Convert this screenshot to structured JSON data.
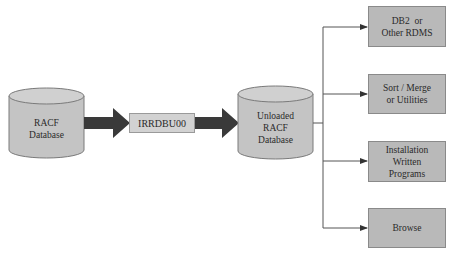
{
  "diagram": {
    "source": {
      "label_lines": [
        "RACF",
        "Database"
      ],
      "shape": "cylinder"
    },
    "process": {
      "label": "IRRDBU00",
      "shape": "box"
    },
    "output": {
      "label_lines": [
        "Unloaded",
        "RACF",
        "Database"
      ],
      "shape": "cylinder"
    },
    "targets": [
      {
        "label_lines": [
          "DB2  or",
          "Other RDMS"
        ]
      },
      {
        "label_lines": [
          "Sort / Merge",
          "or Utilities"
        ]
      },
      {
        "label_lines": [
          "Installation",
          "Written",
          "Programs"
        ]
      },
      {
        "label_lines": [
          "Browse"
        ]
      }
    ],
    "colors": {
      "cylinder_fill": "#c4c4c4",
      "box_fill": "#b9b9b9",
      "process_fill": "#d2d2d2",
      "arrow": "#3a3a3a",
      "connector": "#555555"
    }
  }
}
